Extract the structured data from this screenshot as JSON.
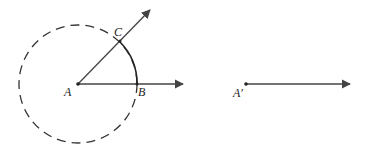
{
  "diagram": {
    "labels": {
      "A": "A",
      "B": "B",
      "C": "C",
      "A_prime": "A′"
    },
    "colors": {
      "stroke": "#333333",
      "ray": "#444444",
      "background": "#ffffff"
    }
  }
}
